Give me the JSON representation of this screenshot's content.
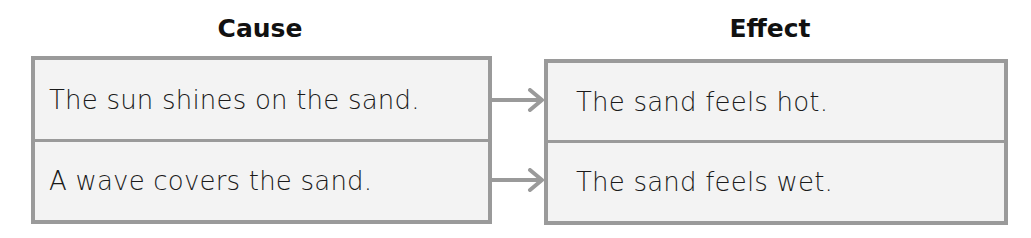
{
  "diagram": {
    "type": "cause-effect table",
    "colors": {
      "border": "#9a9a9a",
      "cell_fill": "#f3f3f3",
      "arrow": "#9a9a9a",
      "text": "#1a1a1a"
    },
    "cause": {
      "heading": "Cause",
      "rows": [
        "The sun shines on the sand.",
        "A wave covers the sand."
      ]
    },
    "effect": {
      "heading": "Effect",
      "rows": [
        "The sand feels hot.",
        "The sand feels wet."
      ]
    },
    "arrows": [
      {
        "from": "cause.rows.0",
        "to": "effect.rows.0",
        "icon": "arrow-right-icon"
      },
      {
        "from": "cause.rows.1",
        "to": "effect.rows.1",
        "icon": "arrow-right-icon"
      }
    ]
  }
}
